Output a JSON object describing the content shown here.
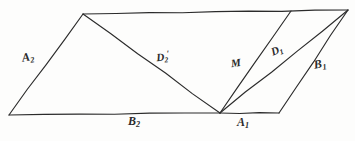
{
  "figure": {
    "kind": "hand-drawn-geometry-diagram",
    "background_color": "#fdfdfc",
    "ink_color": "#2b2b2b",
    "canvas": {
      "width": 355,
      "height": 141
    },
    "vertices": {
      "bottom_left": {
        "x": 9,
        "y": 115
      },
      "top_left": {
        "x": 83,
        "y": 14
      },
      "center_bottom": {
        "x": 220,
        "y": 113
      },
      "bottom_right": {
        "x": 279,
        "y": 113
      },
      "top_mid_right": {
        "x": 291,
        "y": 11
      },
      "top_right": {
        "x": 348,
        "y": 10
      }
    },
    "edges": [
      {
        "name": "side-A2",
        "from": "bottom_left",
        "to": "top_left",
        "label": "A2"
      },
      {
        "name": "top-edge",
        "from": "top_left",
        "to": "top_right",
        "label": ""
      },
      {
        "name": "bottom-edge-B2",
        "from": "bottom_left",
        "to": "center_bottom",
        "label": "B2"
      },
      {
        "name": "bottom-edge-A1",
        "from": "center_bottom",
        "to": "bottom_right",
        "label": "A1"
      },
      {
        "name": "side-B1",
        "from": "bottom_right",
        "to": "top_right",
        "label": "B1"
      },
      {
        "name": "diagonal-D2prime",
        "from": "top_left",
        "to": "center_bottom",
        "label": "D2'"
      },
      {
        "name": "segment-M",
        "from": "center_bottom",
        "to": "top_mid_right",
        "label": "M"
      },
      {
        "name": "diagonal-D1",
        "from": "center_bottom",
        "to": "top_right",
        "label": "D1"
      }
    ],
    "labels": [
      {
        "name": "label-A2",
        "base": "A",
        "sub": "2",
        "prime": false,
        "x": 28,
        "y": 58,
        "rotate": -9,
        "size": 12
      },
      {
        "name": "label-B2",
        "base": "B",
        "sub": "2",
        "prime": false,
        "x": 134,
        "y": 122,
        "rotate": 0,
        "size": 12
      },
      {
        "name": "label-A1",
        "base": "A",
        "sub": "1",
        "prime": false,
        "x": 243,
        "y": 123,
        "rotate": 0,
        "size": 12
      },
      {
        "name": "label-B1",
        "base": "B",
        "sub": "1",
        "prime": false,
        "x": 320,
        "y": 65,
        "rotate": -10,
        "size": 12
      },
      {
        "name": "label-D2-prime",
        "base": "D",
        "sub": "2",
        "prime": true,
        "x": 163,
        "y": 57,
        "rotate": -6,
        "size": 11
      },
      {
        "name": "label-M",
        "base": "M",
        "sub": "",
        "prime": false,
        "x": 236,
        "y": 64,
        "rotate": -8,
        "size": 11
      },
      {
        "name": "label-D1",
        "base": "D",
        "sub": "1",
        "prime": false,
        "x": 277,
        "y": 51,
        "rotate": -22,
        "size": 11
      }
    ]
  }
}
